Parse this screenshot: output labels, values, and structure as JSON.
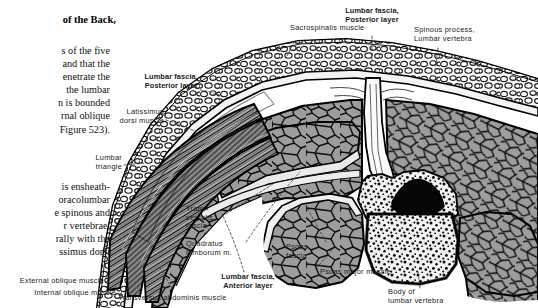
{
  "page": {
    "width": 538,
    "height": 308,
    "background": "#ffffff",
    "ink": "#1a1a1a"
  },
  "book_text": {
    "heading": "of the Back,",
    "paragraph_1": [
      "s of the five",
      "and that the",
      "enetrate  the",
      "the   lumbar",
      "n is bounded",
      "rnal oblique",
      "Figure 523)."
    ],
    "paragraph_2": [
      "is ensheath-",
      "oracolumbar",
      "e spinous and",
      "r  vertebrae,",
      "rally with the",
      "ssimus dorsi"
    ]
  },
  "figure": {
    "labels": [
      {
        "id": "sacrospinalis",
        "text": "Sacrospinalis muscle",
        "bold": false,
        "align": "left"
      },
      {
        "id": "lumbar-fascia-post-top",
        "text": "Lumbar fascia,\nPosterior layer",
        "bold": true,
        "align": "center"
      },
      {
        "id": "spinous-process",
        "text": "Spinous process,\nLumbar vertebra",
        "bold": false,
        "align": "left"
      },
      {
        "id": "lumbar-fascia-post-left",
        "text": "Lumbar fascia,\nPosterior layer",
        "bold": true,
        "align": "right"
      },
      {
        "id": "latissimus",
        "text": "Latissimus\ndorsi muscle",
        "bold": false,
        "align": "right"
      },
      {
        "id": "lumbar-triangle",
        "text": "Lumbar\ntriangle",
        "bold": false,
        "align": "right"
      },
      {
        "id": "transversalis",
        "text": "Trans-\nversalis\nfascia",
        "bold": false,
        "align": "left"
      },
      {
        "id": "quadratus",
        "text": "Quadratus\nlumborum m.",
        "bold": false,
        "align": "left"
      },
      {
        "id": "psoas-fascia",
        "text": "Psoas\nfascia",
        "bold": false,
        "align": "left"
      },
      {
        "id": "lumbar-fascia-ant",
        "text": "Lumbar fascia,\nAnterior layer",
        "bold": true,
        "align": "center"
      },
      {
        "id": "psoas-major",
        "text": "Psoas major muscle",
        "bold": false,
        "align": "left"
      },
      {
        "id": "body-lumbar-vert",
        "text": "Body of\nlumbar vertebra",
        "bold": false,
        "align": "left"
      },
      {
        "id": "external-oblique",
        "text": "External oblique muscle",
        "bold": false,
        "align": "right"
      },
      {
        "id": "internal-oblique",
        "text": "Internal oblique muscle",
        "bold": false,
        "align": "right"
      },
      {
        "id": "transversus-abd",
        "text": "Transversus abdominis muscle",
        "bold": false,
        "align": "left"
      }
    ],
    "structures": [
      {
        "id": "skin-line",
        "name": "skin surface outline"
      },
      {
        "id": "subcutaneous-fat",
        "name": "subcutaneous fat layer"
      },
      {
        "id": "sacrospinalis-mass",
        "name": "sacrospinalis muscle mass"
      },
      {
        "id": "spinous-process-bone",
        "name": "spinous process"
      },
      {
        "id": "vertebral-body",
        "name": "vertebral body cancellous bone"
      },
      {
        "id": "vertebral-canal",
        "name": "vertebral canal"
      },
      {
        "id": "psoas-major-mass",
        "name": "psoas major muscle"
      },
      {
        "id": "quadratus-mass",
        "name": "quadratus lumborum muscle"
      },
      {
        "id": "oblique-layers",
        "name": "abdominal oblique muscle layers"
      }
    ],
    "colors": {
      "muscle_fill": "#9a9a9a",
      "muscle_line": "#141414",
      "fat_fill": "#ffffff",
      "bone_fill": "#efefef",
      "canal_fill": "#050505",
      "outline": "#000000"
    }
  }
}
